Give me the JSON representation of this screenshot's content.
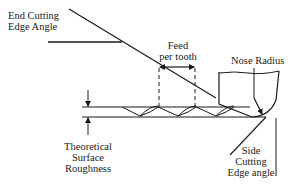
{
  "diagram": {
    "labels": {
      "end_cutting_edge_angle": [
        "End Cutting",
        "Edge Angle"
      ],
      "feed_per_tooth": [
        "Feed",
        "per tooth"
      ],
      "nose_radius": "Nose Radius",
      "theoretical_surface_roughness": [
        "Theoretical",
        "Surface",
        "Roughness"
      ],
      "side_cutting_edge_angle": [
        "Side",
        "Cutting",
        "Edge angle"
      ]
    },
    "colors": {
      "line": "#1a1a1a",
      "background": "#ffffff"
    }
  }
}
